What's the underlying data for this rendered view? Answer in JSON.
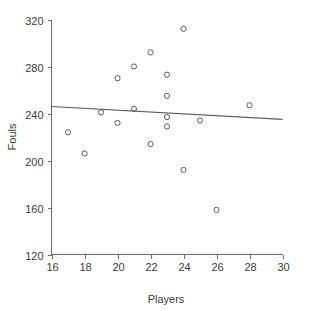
{
  "chart_data": {
    "type": "scatter",
    "title": "",
    "xlabel": "Players",
    "ylabel": "Fouls",
    "xlim": [
      16,
      30
    ],
    "ylim": [
      120,
      320
    ],
    "xticks": [
      16,
      18,
      20,
      22,
      24,
      26,
      28,
      30
    ],
    "yticks": [
      120,
      160,
      200,
      240,
      280,
      320
    ],
    "grid": false,
    "legend": null,
    "marker": "open-circle",
    "series": [
      {
        "name": "observations",
        "x": [
          17,
          18,
          19,
          20,
          20,
          21,
          21,
          22,
          22,
          23,
          23,
          23,
          23,
          24,
          24,
          25,
          26,
          28
        ],
        "y": [
          224,
          206,
          241,
          270,
          232,
          280,
          244,
          292,
          214,
          273,
          255,
          237,
          229,
          312,
          192,
          234,
          158,
          247
        ]
      }
    ],
    "trendline": {
      "type": "linear",
      "x": [
        16,
        30
      ],
      "y": [
        246,
        235
      ]
    },
    "colors": {
      "marker_stroke": "#5a5a5a",
      "trendline": "#5a5a5a",
      "axis": "#6e6e6e",
      "text": "#3a3a3a",
      "background": "#ffffff"
    }
  },
  "axes": {
    "x_title": "Players",
    "y_title": "Fouls",
    "x_tick_labels": [
      "16",
      "18",
      "20",
      "22",
      "24",
      "26",
      "28",
      "30"
    ],
    "y_tick_labels": [
      "120",
      "160",
      "200",
      "240",
      "280",
      "320"
    ]
  }
}
